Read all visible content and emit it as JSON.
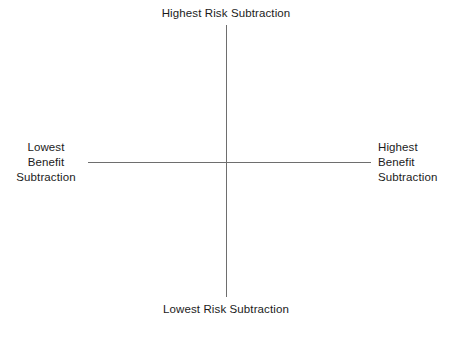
{
  "diagram": {
    "type": "quadrant-axes",
    "background_color": "#ffffff",
    "axis_color": "#6e6e6e",
    "text_color": "#1b1b1b",
    "axes": {
      "vertical": {
        "top_label": "Highest Risk Subtraction",
        "bottom_label": "Lowest Risk Subtraction",
        "dimension": "Risk Subtraction"
      },
      "horizontal": {
        "left_label": "Lowest\nBenefit\nSubtraction",
        "right_label": "Highest\nBenefit\nSubtraction",
        "dimension": "Benefit Subtraction"
      }
    },
    "labels": {
      "top": "Highest Risk Subtraction",
      "bottom": "Lowest Risk Subtraction",
      "left": "Lowest\nBenefit\nSubtraction",
      "right": "Highest\nBenefit\nSubtraction"
    }
  }
}
